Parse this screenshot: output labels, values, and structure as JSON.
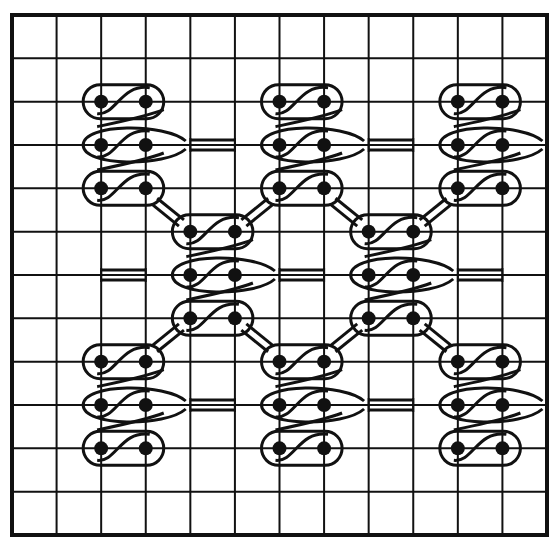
{
  "figure": {
    "colors": {
      "background": "#ffffff",
      "ink": "#111111"
    }
  },
  "grid": {
    "origin": [
      12,
      15
    ],
    "size": [
      535,
      520
    ],
    "columns": 12,
    "rows": 12
  },
  "clusters": [
    {
      "name": "top-left",
      "cols": [
        2,
        3
      ],
      "rows": [
        2,
        3,
        4
      ]
    },
    {
      "name": "top-middle",
      "cols": [
        6,
        7
      ],
      "rows": [
        2,
        3,
        4
      ]
    },
    {
      "name": "top-right",
      "cols": [
        10,
        11
      ],
      "rows": [
        2,
        3,
        4
      ]
    },
    {
      "name": "middle-left",
      "cols": [
        4,
        5
      ],
      "rows": [
        5,
        6,
        7
      ]
    },
    {
      "name": "middle-right",
      "cols": [
        8,
        9
      ],
      "rows": [
        5,
        6,
        7
      ]
    },
    {
      "name": "bottom-left",
      "cols": [
        2,
        3
      ],
      "rows": [
        8,
        9,
        10
      ]
    },
    {
      "name": "bottom-middle",
      "cols": [
        6,
        7
      ],
      "rows": [
        8,
        9,
        10
      ]
    },
    {
      "name": "bottom-right",
      "cols": [
        10,
        11
      ],
      "rows": [
        8,
        9,
        10
      ]
    }
  ],
  "bridges": [
    {
      "row": 3,
      "from": 4,
      "to": 5
    },
    {
      "row": 3,
      "from": 8,
      "to": 9
    },
    {
      "row": 6,
      "from": 2,
      "to": 3
    },
    {
      "row": 6,
      "from": 6,
      "to": 7
    },
    {
      "row": 6,
      "from": 10,
      "to": 11
    },
    {
      "row": 9,
      "from": 4,
      "to": 5
    },
    {
      "row": 9,
      "from": 8,
      "to": 9
    }
  ],
  "diagonals": [
    {
      "from": [
        3.2,
        4.3
      ],
      "to": [
        3.8,
        4.8
      ]
    },
    {
      "from": [
        5.2,
        4.8
      ],
      "to": [
        5.8,
        4.3
      ]
    },
    {
      "from": [
        7.2,
        4.3
      ],
      "to": [
        7.8,
        4.8
      ]
    },
    {
      "from": [
        9.2,
        4.8
      ],
      "to": [
        9.8,
        4.3
      ]
    },
    {
      "from": [
        3.2,
        7.7
      ],
      "to": [
        3.8,
        7.2
      ]
    },
    {
      "from": [
        5.2,
        7.2
      ],
      "to": [
        5.8,
        7.7
      ]
    },
    {
      "from": [
        7.2,
        7.7
      ],
      "to": [
        7.8,
        7.2
      ]
    },
    {
      "from": [
        9.2,
        7.2
      ],
      "to": [
        9.8,
        7.7
      ]
    }
  ]
}
